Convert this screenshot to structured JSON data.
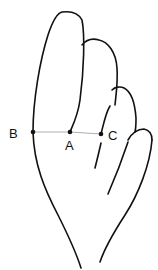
{
  "diagram": {
    "points": [
      {
        "id": "B",
        "label": "B",
        "x": 33,
        "y": 132
      },
      {
        "id": "A",
        "label": "A",
        "x": 70,
        "y": 132
      },
      {
        "id": "C",
        "label": "C",
        "x": 101,
        "y": 134
      }
    ],
    "labels": {
      "B": "B",
      "A": "A",
      "C": "C"
    },
    "colors": {
      "stroke": "#111111",
      "measure_line": "#999999",
      "background": "#ffffff"
    }
  }
}
